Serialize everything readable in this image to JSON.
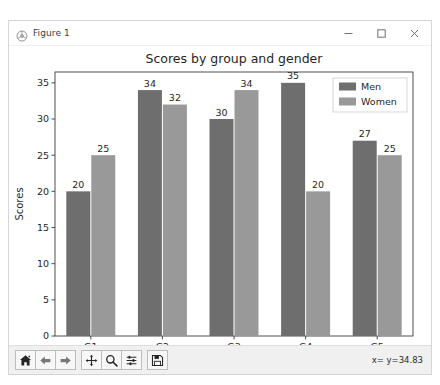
{
  "window": {
    "title": "Figure 1",
    "app_icon": "matplotlib-icon",
    "controls": {
      "minimize": "minimize-icon",
      "maximize": "maximize-icon",
      "close": "close-icon"
    }
  },
  "toolbar": {
    "buttons": [
      {
        "name": "home-button",
        "icon": "home-icon",
        "label": "Home"
      },
      {
        "name": "back-button",
        "icon": "arrow-left-icon",
        "label": "Back"
      },
      {
        "name": "forward-button",
        "icon": "arrow-right-icon",
        "label": "Forward"
      },
      {
        "name": "pan-button",
        "icon": "move-icon",
        "label": "Pan"
      },
      {
        "name": "zoom-button",
        "icon": "magnifier-icon",
        "label": "Zoom"
      },
      {
        "name": "configure-subplots-button",
        "icon": "sliders-icon",
        "label": "Configure subplots"
      },
      {
        "name": "save-button",
        "icon": "floppy-disk-icon",
        "label": "Save"
      }
    ],
    "coordinates": "x= y=34.83"
  },
  "chart_data": {
    "type": "bar",
    "title": "Scores by group and gender",
    "xlabel": "",
    "ylabel": "Scores",
    "categories": [
      "G1",
      "G2",
      "G3",
      "G4",
      "G5"
    ],
    "series": [
      {
        "name": "Men",
        "values": [
          20,
          34,
          30,
          35,
          27
        ],
        "color": "#6e6e6e"
      },
      {
        "name": "Women",
        "values": [
          25,
          32,
          34,
          20,
          25
        ],
        "color": "#999999"
      }
    ],
    "ylim": [
      0,
      36.5
    ],
    "yticks": [
      0,
      5,
      10,
      15,
      20,
      25,
      30,
      35
    ],
    "grid": false,
    "legend_position": "upper right",
    "bar_labels": true
  }
}
